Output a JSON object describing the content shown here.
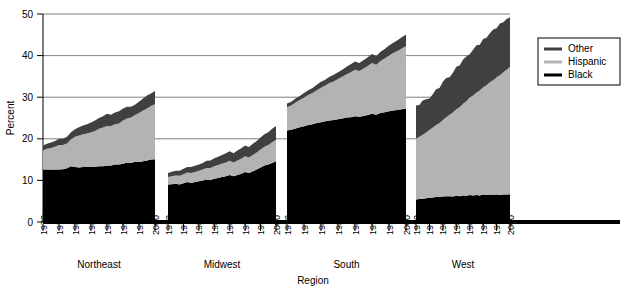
{
  "chart_data": {
    "type": "area",
    "title": "",
    "subtitle": "",
    "xlabel": "Region",
    "ylabel": "Percent",
    "ylim": [
      0,
      50
    ],
    "yticks": [
      0,
      10,
      20,
      30,
      40,
      50
    ],
    "ytick_labels": [
      "0",
      "10",
      "20",
      "30",
      "40",
      "50"
    ],
    "gridlines": true,
    "grid_values": [
      20,
      30,
      40,
      50
    ],
    "stacked": true,
    "stack_order_bottom_to_top": [
      "Black",
      "Hispanic",
      "Other"
    ],
    "legend": {
      "position": "right",
      "entries": [
        {
          "label": "Other",
          "color": "#404040"
        },
        {
          "label": "Hispanic",
          "color": "#b3b3b3"
        },
        {
          "label": "Black",
          "color": "#000000"
        }
      ]
    },
    "xtick_labels": [
      "1972",
      "1976",
      "1980",
      "1984",
      "1988",
      "1992",
      "1996",
      "2000"
    ],
    "x_years": [
      1972,
      1973,
      1974,
      1975,
      1976,
      1977,
      1978,
      1979,
      1980,
      1981,
      1982,
      1983,
      1984,
      1985,
      1986,
      1987,
      1988,
      1989,
      1990,
      1991,
      1992,
      1993,
      1994,
      1995,
      1996,
      1997,
      1998,
      1999,
      2000
    ],
    "panels": [
      {
        "name": "Northeast",
        "series": [
          {
            "name": "Black",
            "values": [
              12.6,
              12.6,
              12.6,
              12.6,
              12.6,
              12.7,
              12.9,
              13.4,
              13.2,
              13.1,
              13.2,
              13.2,
              13.3,
              13.3,
              13.4,
              13.4,
              13.5,
              13.6,
              13.8,
              13.8,
              14.0,
              14.3,
              14.2,
              14.5,
              14.4,
              14.6,
              14.8,
              15.0,
              15.1
            ]
          },
          {
            "name": "Hispanic",
            "values": [
              4.6,
              5.0,
              5.2,
              5.5,
              5.9,
              5.8,
              6.0,
              6.5,
              7.3,
              7.7,
              7.9,
              8.1,
              8.3,
              8.6,
              9.0,
              9.3,
              9.6,
              9.5,
              9.7,
              9.9,
              10.4,
              10.6,
              10.9,
              11.2,
              11.8,
              12.2,
              12.5,
              12.9,
              13.2
            ]
          },
          {
            "name": "Other",
            "values": [
              1.2,
              1.2,
              1.3,
              1.4,
              1.5,
              1.5,
              1.6,
              1.7,
              1.8,
              2.0,
              2.1,
              2.2,
              2.3,
              2.5,
              2.6,
              2.7,
              2.9,
              2.7,
              2.8,
              2.9,
              2.9,
              2.8,
              2.6,
              2.5,
              2.7,
              2.9,
              3.1,
              3.0,
              3.2
            ]
          }
        ],
        "total_start": 18.4,
        "total_end": 31.5
      },
      {
        "name": "Midwest",
        "series": [
          {
            "name": "Black",
            "values": [
              9.0,
              9.1,
              9.2,
              9.0,
              9.3,
              9.6,
              9.4,
              9.6,
              9.8,
              10.0,
              10.2,
              10.1,
              10.4,
              10.6,
              10.8,
              11.0,
              11.3,
              11.0,
              11.3,
              11.6,
              12.0,
              11.8,
              12.2,
              12.6,
              13.1,
              13.6,
              13.8,
              14.2,
              14.6
            ]
          },
          {
            "name": "Hispanic",
            "values": [
              1.8,
              1.9,
              2.0,
              2.1,
              2.2,
              2.3,
              2.4,
              2.4,
              2.5,
              2.6,
              2.8,
              2.9,
              3.0,
              3.1,
              3.2,
              3.3,
              3.4,
              3.3,
              3.5,
              3.6,
              3.8,
              3.7,
              3.9,
              4.1,
              4.3,
              4.5,
              4.7,
              5.0,
              5.2
            ]
          },
          {
            "name": "Other",
            "values": [
              1.0,
              1.1,
              1.1,
              1.2,
              1.3,
              1.3,
              1.4,
              1.5,
              1.5,
              1.6,
              1.7,
              1.8,
              1.9,
              2.0,
              2.1,
              2.2,
              2.3,
              2.2,
              2.4,
              2.5,
              2.6,
              2.5,
              2.7,
              2.8,
              2.9,
              3.0,
              3.1,
              3.2,
              3.3
            ]
          }
        ],
        "total_start": 11.8,
        "total_end": 23.1
      },
      {
        "name": "South",
        "series": [
          {
            "name": "Black",
            "values": [
              22.0,
              22.2,
              22.5,
              22.8,
              23.0,
              23.3,
              23.5,
              23.8,
              24.0,
              24.2,
              24.4,
              24.5,
              24.7,
              24.9,
              25.1,
              25.2,
              25.4,
              25.3,
              25.5,
              25.7,
              26.0,
              25.8,
              26.2,
              26.4,
              26.6,
              26.8,
              26.9,
              27.1,
              27.3
            ]
          },
          {
            "name": "Hispanic",
            "values": [
              5.6,
              5.8,
              6.2,
              6.5,
              6.9,
              7.2,
              7.5,
              7.9,
              8.3,
              8.6,
              9.0,
              9.3,
              9.7,
              10.0,
              10.4,
              10.8,
              11.2,
              11.0,
              11.4,
              11.8,
              12.2,
              12.0,
              12.5,
              12.9,
              13.4,
              13.8,
              14.2,
              14.6,
              15.0
            ]
          },
          {
            "name": "Other",
            "values": [
              0.9,
              0.9,
              1.0,
              1.0,
              1.1,
              1.2,
              1.2,
              1.3,
              1.4,
              1.4,
              1.5,
              1.6,
              1.6,
              1.7,
              1.8,
              1.9,
              2.0,
              1.9,
              2.0,
              2.1,
              2.2,
              2.1,
              2.2,
              2.3,
              2.4,
              2.5,
              2.6,
              2.7,
              2.8
            ]
          }
        ],
        "total_start": 28.5,
        "total_end": 45.1
      },
      {
        "name": "West",
        "series": [
          {
            "name": "Black",
            "values": [
              5.4,
              5.5,
              5.6,
              5.7,
              5.8,
              5.9,
              6.0,
              6.0,
              6.1,
              6.2,
              6.2,
              6.1,
              6.3,
              6.2,
              6.4,
              6.3,
              6.5,
              6.4,
              6.5,
              6.4,
              6.6,
              6.5,
              6.6,
              6.5,
              6.6,
              6.5,
              6.6,
              6.6,
              6.7
            ]
          },
          {
            "name": "Hispanic",
            "values": [
              14.6,
              15.0,
              15.4,
              15.8,
              16.3,
              16.8,
              17.3,
              17.8,
              18.4,
              19.0,
              19.6,
              20.2,
              20.8,
              21.4,
              22.0,
              22.7,
              23.4,
              24.0,
              24.6,
              25.2,
              25.8,
              26.4,
              27.0,
              27.6,
              28.2,
              28.8,
              29.4,
              30.0,
              30.6
            ]
          },
          {
            "name": "Other",
            "values": [
              8.0,
              7.6,
              8.2,
              8.0,
              7.6,
              8.0,
              8.6,
              8.4,
              9.2,
              9.4,
              9.0,
              9.6,
              10.2,
              10.0,
              10.6,
              10.8,
              10.4,
              11.0,
              11.4,
              11.0,
              11.6,
              11.4,
              11.8,
              12.2,
              11.8,
              12.4,
              12.0,
              12.2,
              11.9
            ]
          }
        ],
        "total_start": 28.0,
        "total_end": 49.2
      }
    ]
  }
}
